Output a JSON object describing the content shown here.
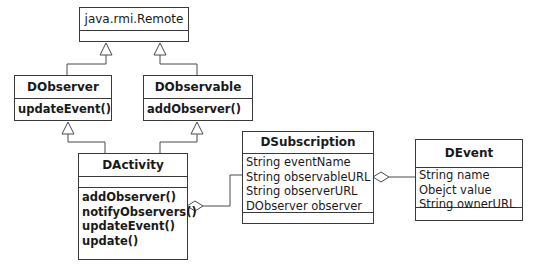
{
  "diagram": {
    "type": "UML class diagram",
    "classes": {
      "remote": {
        "name": "java.rmi.Remote",
        "attributes": [],
        "operations": []
      },
      "dobserver": {
        "name": "DObserver",
        "attributes": [],
        "operations": [
          "updateEvent()"
        ]
      },
      "dobservable": {
        "name": "DObservable",
        "attributes": [],
        "operations": [
          "addObserver()"
        ]
      },
      "dactivity": {
        "name": "DActivity",
        "attributes": [],
        "operations": [
          "addObserver()",
          "notifyObservers()",
          "updateEvent()",
          "update()"
        ]
      },
      "dsubscription": {
        "name": "DSubscription",
        "attributes": [
          "String eventName",
          "String observableURL",
          "String observerURL",
          "DObserver observer"
        ],
        "operations": []
      },
      "devent": {
        "name": "DEvent",
        "attributes": [
          "String name",
          "Obejct value",
          "String ownerURL"
        ],
        "operations": []
      }
    },
    "relationships": [
      {
        "type": "generalization",
        "from": "DObserver",
        "to": "java.rmi.Remote"
      },
      {
        "type": "generalization",
        "from": "DObservable",
        "to": "java.rmi.Remote"
      },
      {
        "type": "generalization",
        "from": "DActivity",
        "to": "DObserver"
      },
      {
        "type": "generalization",
        "from": "DActivity",
        "to": "DObservable"
      },
      {
        "type": "aggregation",
        "whole": "DActivity",
        "part": "DSubscription"
      },
      {
        "type": "aggregation",
        "whole": "DSubscription",
        "part": "DEvent"
      }
    ]
  }
}
